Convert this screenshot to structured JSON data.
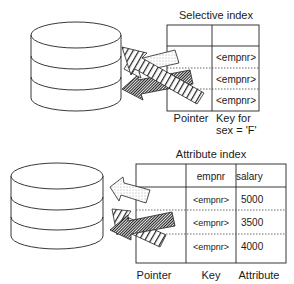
{
  "selective_index": {
    "title": "Selective index",
    "rows": [
      {
        "pointer": "",
        "key": ""
      },
      {
        "pointer": "",
        "key": "<empnr>"
      },
      {
        "pointer": "",
        "key": "<empnr>"
      },
      {
        "pointer": "",
        "key": "<empnr>"
      }
    ],
    "footer": {
      "pointer_label": "Pointer",
      "key_label_line1": "Key for",
      "key_label_line2": "sex = 'F'"
    }
  },
  "attribute_index": {
    "title": "Attribute index",
    "header": {
      "pointer": "",
      "key": "empnr",
      "attribute": "salary"
    },
    "rows": [
      {
        "key": "<empnr>",
        "attribute": "5000"
      },
      {
        "key": "<empnr>",
        "attribute": "3500"
      },
      {
        "key": "<empnr>",
        "attribute": "4000"
      }
    ],
    "footer": {
      "pointer_label": "Pointer",
      "key_label": "Key",
      "attribute_label": "Attribute"
    }
  },
  "icons": {
    "database": "database-cylinder-icon",
    "arrow_dotted": "dotted-arrow-icon",
    "arrow_striped": "striped-arrow-icon",
    "arrow_hatched": "hatched-arrow-icon"
  }
}
